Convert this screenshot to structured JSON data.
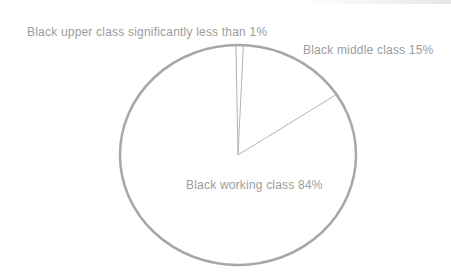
{
  "chart_data": {
    "type": "pie",
    "title": "",
    "legend_position": "none",
    "fill_style": "outline-only",
    "slices": [
      {
        "label": "Black upper class",
        "display": "Black upper class significantly less than 1%",
        "value_pct": 1,
        "note_as_shown": "significantly less than 1%"
      },
      {
        "label": "Black middle class",
        "display": "Black middle class 15%",
        "value_pct": 15
      },
      {
        "label": "Black working class",
        "display": "Black working class 84%",
        "value_pct": 84
      }
    ],
    "style": {
      "outline_color": "#a7a7a7",
      "divider_color": "#b3b3b3",
      "label_color": "#9c9c9c",
      "background_color": "#ffffff",
      "start_rotation_deg": -1,
      "direction": "clockwise"
    }
  }
}
